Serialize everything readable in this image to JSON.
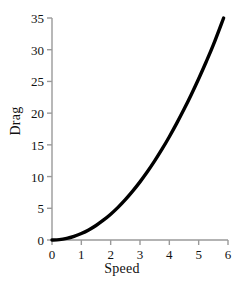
{
  "chart_data": {
    "type": "line",
    "title": "",
    "xlabel": "Speed",
    "ylabel": "Drag",
    "xlim": [
      0,
      6
    ],
    "ylim": [
      0,
      35
    ],
    "grid": false,
    "legend": null,
    "xticks": [
      "0",
      "1",
      "2",
      "3",
      "4",
      "5",
      "6"
    ],
    "yticks": [
      "0",
      "5",
      "10",
      "15",
      "20",
      "25",
      "30",
      "35"
    ],
    "xtick_values": [
      0,
      1,
      2,
      3,
      4,
      5,
      6
    ],
    "ytick_values": [
      0,
      5,
      10,
      15,
      20,
      25,
      30,
      35
    ],
    "series": [
      {
        "name": "drag",
        "color": "#000000",
        "line_width": 3.4,
        "x": [
          0.0,
          0.25,
          0.5,
          0.75,
          1.0,
          1.25,
          1.5,
          1.75,
          2.0,
          2.25,
          2.5,
          2.75,
          3.0,
          3.25,
          3.5,
          3.75,
          4.0,
          4.25,
          4.5,
          4.75,
          5.0,
          5.25,
          5.5,
          5.85
        ],
        "values": [
          0.0,
          0.06,
          0.25,
          0.57,
          1.02,
          1.59,
          2.29,
          3.12,
          4.07,
          5.15,
          6.36,
          7.7,
          9.16,
          10.75,
          12.47,
          14.31,
          16.28,
          18.38,
          20.6,
          22.95,
          25.43,
          28.03,
          30.76,
          35.0
        ]
      }
    ],
    "axis_color": "#9a9a9a",
    "axis_width": 1.4,
    "tick_length": 5,
    "background": "#ffffff"
  },
  "geometry": {
    "plot_left": 52,
    "plot_right": 228,
    "plot_top": 18,
    "plot_bottom": 240
  }
}
